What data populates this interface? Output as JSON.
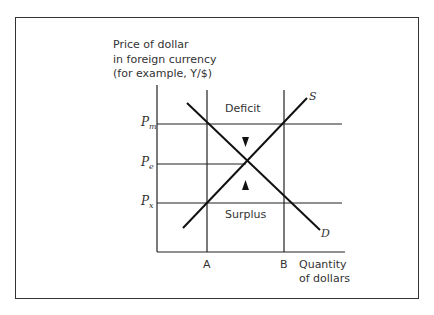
{
  "diagram": {
    "y_axis_label": [
      "Price of dollar",
      "in foreign currency",
      "(for example, Y/$)"
    ],
    "x_axis_label": [
      "Quantity",
      "of dollars"
    ],
    "price_levels": [
      {
        "symbol": "P",
        "sub": "m"
      },
      {
        "symbol": "P",
        "sub": "e"
      },
      {
        "symbol": "P",
        "sub": "x"
      }
    ],
    "quantity_marks": [
      "A",
      "B"
    ],
    "curves": {
      "supply": "S",
      "demand": "D"
    },
    "regions": {
      "deficit": "Deficit",
      "surplus": "Surplus"
    }
  }
}
